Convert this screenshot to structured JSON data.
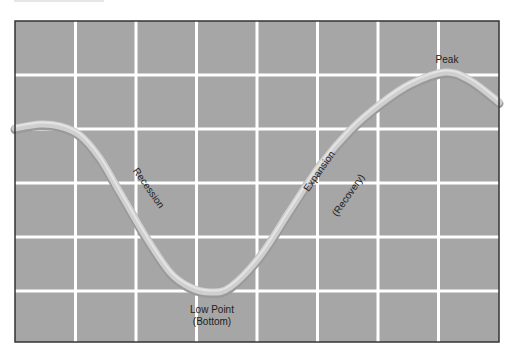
{
  "chart_data": {
    "type": "line",
    "title": "",
    "xlabel": "",
    "ylabel": "",
    "grid": true,
    "grid_columns": 8,
    "grid_rows": 6,
    "axis_ticks": "none",
    "colors": {
      "background": "#a6a6a6",
      "grid": "#ffffff",
      "frame": "#333333",
      "curve": "#cfcfcf",
      "curve_highlight": "#e4e4e4",
      "text": "#222222"
    },
    "plot_box": {
      "x": 15,
      "y": 21,
      "width": 484,
      "height": 321
    },
    "curve_points_px": [
      [
        15,
        128
      ],
      [
        40,
        124
      ],
      [
        60,
        126
      ],
      [
        80,
        135
      ],
      [
        100,
        158
      ],
      [
        120,
        192
      ],
      [
        145,
        235
      ],
      [
        170,
        272
      ],
      [
        190,
        287
      ],
      [
        210,
        292
      ],
      [
        230,
        287
      ],
      [
        260,
        256
      ],
      [
        290,
        210
      ],
      [
        320,
        165
      ],
      [
        350,
        130
      ],
      [
        380,
        104
      ],
      [
        410,
        84
      ],
      [
        445,
        72
      ],
      [
        470,
        80
      ],
      [
        499,
        102
      ]
    ],
    "annotations": [
      {
        "id": "recession",
        "text": "Recession",
        "x": 146,
        "y": 190,
        "rotate": 55
      },
      {
        "id": "low-point",
        "text": "Low Point",
        "x": 212,
        "y": 313,
        "rotate": 0
      },
      {
        "id": "low-point-sub",
        "text": "(Bottom)",
        "x": 212,
        "y": 325,
        "rotate": 0
      },
      {
        "id": "expansion",
        "text": "Expansion",
        "x": 322,
        "y": 173,
        "rotate": -55
      },
      {
        "id": "expansion-sub",
        "text": "(Recovery)",
        "x": 351,
        "y": 197,
        "rotate": -55
      },
      {
        "id": "peak",
        "text": "Peak",
        "x": 447,
        "y": 63,
        "rotate": 0
      }
    ]
  },
  "labels": {
    "recession": "Recession",
    "low_point": "Low Point",
    "low_point_sub": "(Bottom)",
    "expansion": "Expansion",
    "expansion_sub": "(Recovery)",
    "peak": "Peak"
  }
}
